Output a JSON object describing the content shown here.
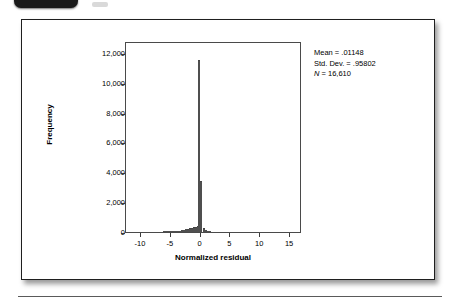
{
  "figure": {
    "badge_icon": "figure-number-tab"
  },
  "chart_data": {
    "type": "bar",
    "title": "",
    "subtitle": "",
    "xlabel": "Normalized residual",
    "ylabel": "Frequency",
    "xlim": [
      -12.5,
      17.0
    ],
    "ylim": [
      0,
      12800
    ],
    "grid": false,
    "legend_position": "none",
    "x_ticks": [
      -10,
      -5,
      0,
      5,
      10,
      15
    ],
    "x_tick_labels": [
      "-10",
      "-5",
      "0",
      "5",
      "10",
      "15"
    ],
    "y_ticks": [
      0,
      2000,
      4000,
      6000,
      8000,
      10000,
      12000
    ],
    "y_tick_labels": [
      "0",
      "2,000",
      "4,000",
      "6,000",
      "8,000",
      "10,000",
      "12,000"
    ],
    "bin_width": 0.33,
    "x": [
      -6.1,
      -5.8,
      -5.4,
      -5.1,
      -4.8,
      -4.4,
      -4.1,
      -3.8,
      -3.4,
      -3.1,
      -2.8,
      -2.4,
      -2.1,
      -1.8,
      -1.4,
      -1.1,
      -0.8,
      -0.5,
      -0.2,
      0.15,
      0.5,
      0.85,
      1.2,
      1.55
    ],
    "values": [
      18,
      22,
      25,
      30,
      35,
      42,
      55,
      70,
      95,
      120,
      150,
      185,
      215,
      250,
      285,
      320,
      355,
      395,
      11500,
      3400,
      300,
      160,
      70,
      25
    ],
    "annotations": [
      {
        "name": "mean",
        "text": "Mean = .01148"
      },
      {
        "name": "std-dev",
        "text": "Std. Dev. = .95802"
      },
      {
        "name": "sample-size",
        "text": "= 16,610",
        "symbol": "N"
      }
    ],
    "peak_value": 11500,
    "second_peak_value": 3400,
    "colors": {
      "bar_fill": "#8d8d8d",
      "bar_outline": "#4f4f4f",
      "axis": "#3d3d3d",
      "text": "#000000",
      "background": "#ffffff"
    }
  }
}
